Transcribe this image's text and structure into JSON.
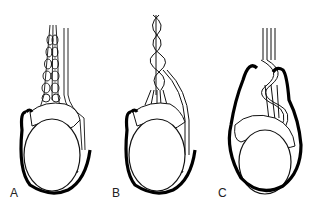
{
  "figure": {
    "panels": [
      {
        "label": "A",
        "description": "normal anatomy"
      },
      {
        "label": "B",
        "description": "intravaginal torsion"
      },
      {
        "label": "C",
        "description": "extravaginal torsion"
      }
    ]
  }
}
